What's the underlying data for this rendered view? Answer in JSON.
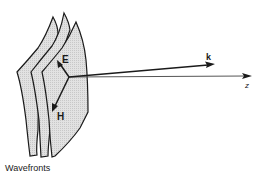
{
  "diagram": {
    "labels": {
      "e_field": "E",
      "h_field": "H",
      "wave_vector": "k",
      "axis": "z",
      "wavefronts": "Wavefronts"
    },
    "colors": {
      "stroke": "#1a1a1a",
      "fill": "#dcdcdc",
      "background": "#ffffff"
    }
  }
}
